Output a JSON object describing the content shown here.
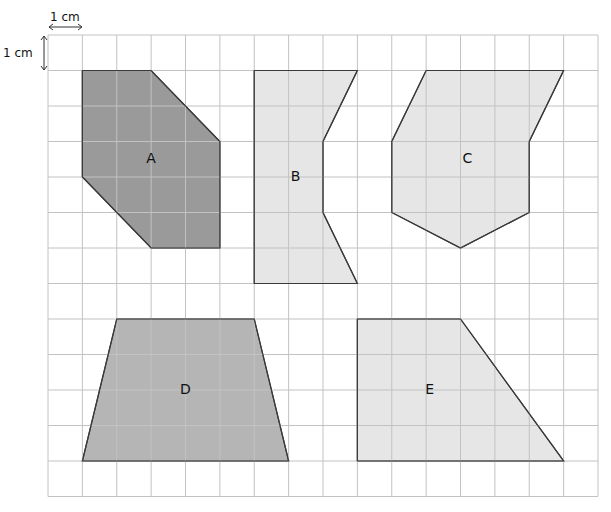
{
  "grid": {
    "origin_x": 48,
    "origin_y": 35,
    "cols": 16,
    "rows": 13,
    "cell_w": 34.375,
    "cell_h": 35.5
  },
  "scale": {
    "horizontal_label": "1 cm",
    "vertical_label": "1 cm"
  },
  "colors": {
    "dark": "#9a9a9a",
    "medium": "#b5b5b5",
    "light": "#e6e6e6",
    "grid": "#c2c2c2"
  },
  "shapes": [
    {
      "label": "A",
      "fill": "dark",
      "points": [
        [
          1,
          1
        ],
        [
          3,
          1
        ],
        [
          5,
          3
        ],
        [
          5,
          6
        ],
        [
          3,
          6
        ],
        [
          1,
          4
        ]
      ],
      "label_pos": [
        3,
        3.5
      ]
    },
    {
      "label": "B",
      "fill": "light",
      "points": [
        [
          6,
          1
        ],
        [
          9,
          1
        ],
        [
          8,
          3
        ],
        [
          8,
          5
        ],
        [
          9,
          7
        ],
        [
          6,
          7
        ]
      ],
      "label_pos": [
        7.2,
        4
      ]
    },
    {
      "label": "C",
      "fill": "light",
      "points": [
        [
          11,
          1
        ],
        [
          15,
          1
        ],
        [
          14,
          3
        ],
        [
          14,
          5
        ],
        [
          12,
          6
        ],
        [
          10,
          5
        ],
        [
          10,
          3
        ]
      ],
      "label_pos": [
        12.2,
        3.5
      ]
    },
    {
      "label": "D",
      "fill": "medium",
      "points": [
        [
          2,
          8
        ],
        [
          6,
          8
        ],
        [
          7,
          12
        ],
        [
          1,
          12
        ]
      ],
      "label_pos": [
        4,
        10
      ]
    },
    {
      "label": "E",
      "fill": "light",
      "points": [
        [
          9,
          8
        ],
        [
          12,
          8
        ],
        [
          15,
          12
        ],
        [
          9,
          12
        ]
      ],
      "label_pos": [
        11.1,
        10
      ]
    }
  ]
}
